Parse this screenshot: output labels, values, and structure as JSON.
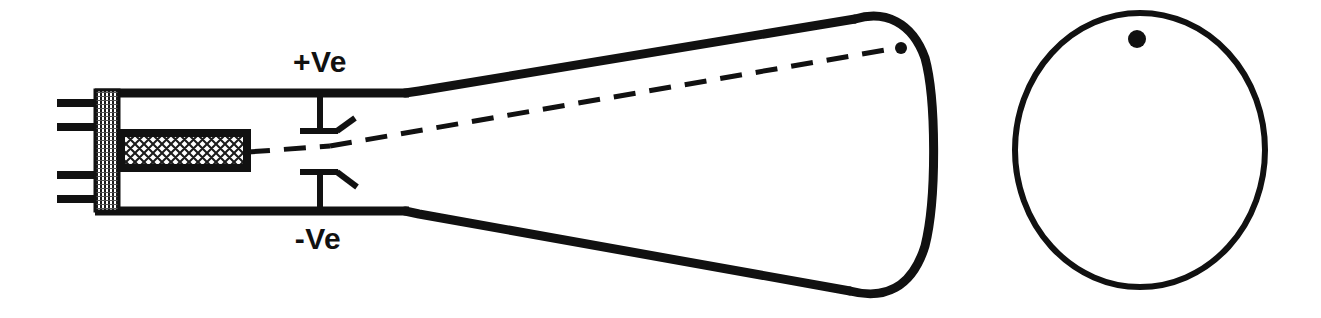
{
  "diagram": {
    "type": "schematic-line-drawing",
    "stroke_color": "#111111",
    "background_color": "#ffffff",
    "labels": {
      "positive_plate": "+Ve",
      "negative_plate": "-Ve"
    },
    "parts": {
      "base_pins": "electron-gun-base-pins",
      "base_block": "hatched-base-block",
      "gun": "cross-hatched-electron-gun",
      "tube_neck": "tube-neck-outline",
      "tube_flare": "tube-flare-outline",
      "screen_face": "curved-screen-face",
      "upper_plate": "upper-deflection-plate",
      "lower_plate": "lower-deflection-plate",
      "beam": "dashed-electron-beam",
      "beam_spot": "beam-impact-spot",
      "screen_front": "screen-front-view-circle",
      "screen_front_spot": "screen-front-view-spot"
    },
    "geometry": {
      "pins_y": [
        103,
        127,
        175,
        199
      ],
      "pin_x_start": 57,
      "pin_x_end": 98,
      "base_block": {
        "x": 95,
        "y": 91,
        "w": 23,
        "h": 119
      },
      "gun": {
        "x": 121,
        "y": 133,
        "w": 125,
        "h": 34
      },
      "neck_top_y": 93,
      "neck_bottom_y": 211,
      "neck_x_start": 95,
      "neck_x_end": 405,
      "flare_top_end": {
        "x": 868,
        "y": 16
      },
      "flare_bottom_end": {
        "x": 862,
        "y": 294
      },
      "screen_bulge_x": 936,
      "upper_plate_y": 131,
      "lower_plate_y": 172,
      "plate_x_start": 300,
      "plate_x_end": 338,
      "plate_stem_x": 320,
      "beam_start": {
        "x": 248,
        "y": 152
      },
      "beam_end": {
        "x": 899,
        "y": 48
      },
      "beam_spot": {
        "cx": 901,
        "cy": 48,
        "r": 6
      },
      "screen_circle": {
        "cx": 1140,
        "cy": 150,
        "rx": 125,
        "ry": 137
      },
      "screen_circle_spot": {
        "cx": 1137,
        "cy": 39,
        "r": 9
      }
    }
  }
}
